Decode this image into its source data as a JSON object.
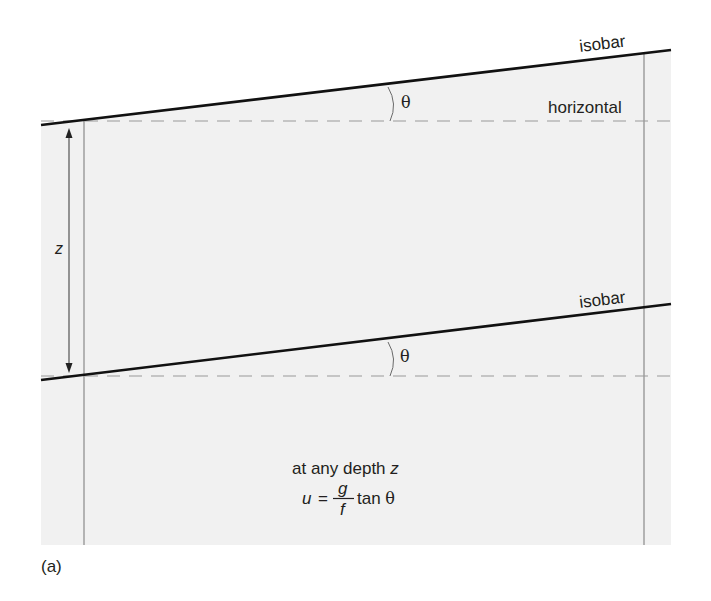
{
  "figure": {
    "panel_label": "(a)",
    "colors": {
      "background": "#ffffff",
      "fluid_fill": "#f1f1f1",
      "isobar": "#111111",
      "guide_line": "#8a8a8a",
      "dashed_horizontal": "#9a9a9a",
      "text": "#231f20"
    },
    "upper": {
      "isobar_label": "isobar",
      "horizontal_label": "horizontal",
      "angle_symbol": "θ"
    },
    "lower": {
      "isobar_label": "isobar",
      "angle_symbol": "θ"
    },
    "depth": {
      "label": "z"
    },
    "equation": {
      "caption_prefix": "at any depth ",
      "caption_var": "z",
      "lhs": "u",
      "equals": "=",
      "numerator": "g",
      "denominator": "f",
      "rhs_func": "tan ",
      "rhs_symbol": "θ"
    }
  }
}
